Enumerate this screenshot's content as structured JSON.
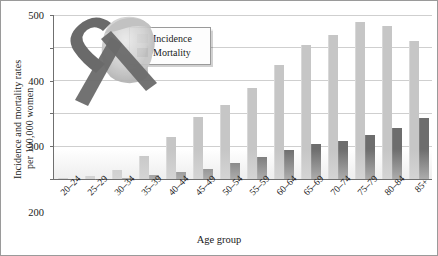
{
  "chart_data": {
    "type": "bar",
    "title": "",
    "xlabel": "Age group",
    "ylabel": "Incidence and mortality rates per 100,000 women",
    "ylabel_line1": "Incidence and mortality rates",
    "ylabel_line2": "per 100,000 women",
    "ylim": [
      0,
      500
    ],
    "yticks": [
      0,
      100,
      200,
      300,
      400,
      500
    ],
    "ytick_labels": [
      "0",
      "100",
      "200",
      "300",
      "400",
      "500"
    ],
    "grid": true,
    "legend_position": "top-left-inset",
    "categories": [
      "20–24",
      "25–29",
      "30–34",
      "35–39",
      "40–44",
      "45–49",
      "50–54",
      "55–59",
      "60–64",
      "65–69",
      "70–74",
      "75–79",
      "80–84",
      "85+"
    ],
    "series": [
      {
        "name": "Incidence",
        "color": "#c6c6c6",
        "values": [
          2,
          8,
          27,
          70,
          128,
          190,
          225,
          277,
          348,
          408,
          440,
          478,
          468,
          420
        ]
      },
      {
        "name": "Mortality",
        "color": "#6d6d6d",
        "values": [
          0,
          1,
          3,
          11,
          21,
          30,
          48,
          68,
          88,
          106,
          116,
          134,
          155,
          185
        ]
      }
    ]
  },
  "legend": {
    "items": [
      {
        "label": "Incidence",
        "color": "#c6c6c6"
      },
      {
        "label": "Mortality",
        "color": "#6d6d6d"
      }
    ]
  },
  "artwork": {
    "name": "awareness-ribbon-and-woman-silhouette",
    "ribbon_color": "#6b6b6b"
  }
}
